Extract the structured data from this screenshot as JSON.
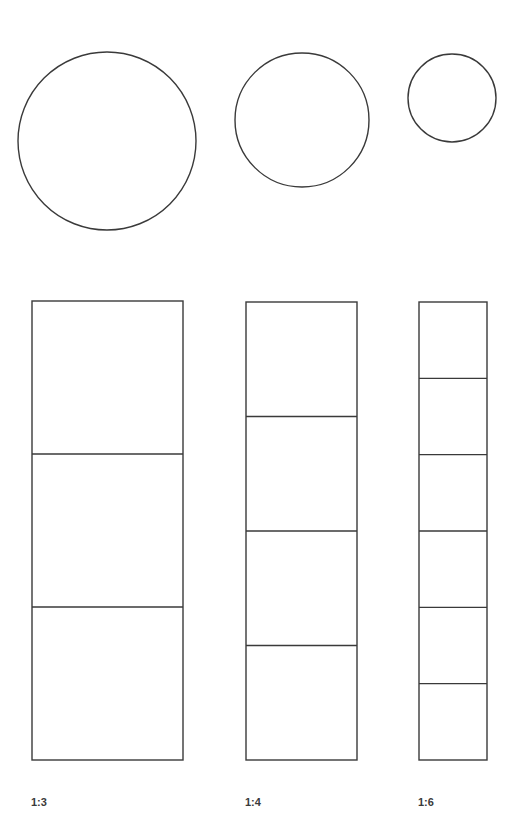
{
  "stroke_color": "#3a3a3a",
  "circles": [
    {
      "cx": 107,
      "cy": 141,
      "r": 89
    },
    {
      "cx": 302,
      "cy": 120,
      "r": 67
    },
    {
      "cx": 452,
      "cy": 98,
      "r": 44
    }
  ],
  "columns": [
    {
      "label": "1:3",
      "x": 32,
      "width": 151,
      "top": 301,
      "bottom": 760,
      "divisions": 3,
      "label_x": 31
    },
    {
      "label": "1:4",
      "x": 246,
      "width": 111,
      "top": 302,
      "bottom": 760,
      "divisions": 4,
      "label_x": 245
    },
    {
      "label": "1:6",
      "x": 419,
      "width": 68,
      "top": 302,
      "bottom": 760,
      "divisions": 6,
      "label_x": 418
    }
  ]
}
